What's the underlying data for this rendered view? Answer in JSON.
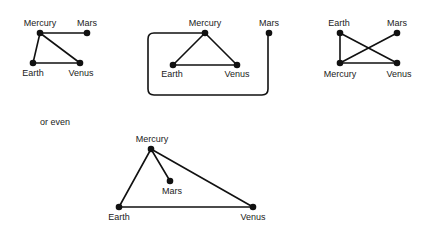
{
  "caption": "or even",
  "planets": {
    "mercury": "Mercury",
    "mars": "Mars",
    "earth": "Earth",
    "venus": "Venus"
  },
  "graphs": [
    {
      "id": "graph-1",
      "nodes": [
        "Mercury",
        "Mars",
        "Earth",
        "Venus"
      ],
      "edges": [
        [
          "Mercury",
          "Mars"
        ],
        [
          "Mercury",
          "Earth"
        ],
        [
          "Mercury",
          "Venus"
        ],
        [
          "Earth",
          "Venus"
        ]
      ]
    },
    {
      "id": "graph-2",
      "nodes": [
        "Mercury",
        "Mars",
        "Earth",
        "Venus"
      ],
      "edges": [
        [
          "Mercury",
          "Earth"
        ],
        [
          "Mercury",
          "Venus"
        ],
        [
          "Earth",
          "Venus"
        ],
        [
          "Mercury",
          "Mars"
        ]
      ],
      "note": "Mercury-Mars edge routed around the triangle"
    },
    {
      "id": "graph-3",
      "nodes": [
        "Earth",
        "Mars",
        "Mercury",
        "Venus"
      ],
      "edges": [
        [
          "Earth",
          "Mercury"
        ],
        [
          "Earth",
          "Venus"
        ],
        [
          "Mercury",
          "Mars"
        ],
        [
          "Mercury",
          "Venus"
        ]
      ]
    },
    {
      "id": "graph-4",
      "nodes": [
        "Mercury",
        "Mars",
        "Earth",
        "Venus"
      ],
      "edges": [
        [
          "Mercury",
          "Earth"
        ],
        [
          "Mercury",
          "Venus"
        ],
        [
          "Mercury",
          "Mars"
        ],
        [
          "Earth",
          "Venus"
        ]
      ]
    }
  ]
}
